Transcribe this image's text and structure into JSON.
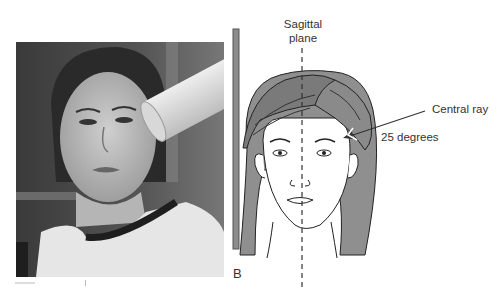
{
  "figure": {
    "panels": [
      {
        "id": "A",
        "label": "A",
        "description": "Photograph of a patient seated facing forward with x-ray tube positioned at the side of the head"
      },
      {
        "id": "B",
        "label": "B",
        "description": "Line drawing of a head, frontal view, with image receptor bar, sagittal plane line and central ray arrow"
      }
    ],
    "annotations": {
      "sagittal_plane_line1": "Sagittal",
      "sagittal_plane_line2": "plane",
      "central_ray": "Central ray",
      "angle": "25 degrees"
    },
    "colors": {
      "hair": "#8a8a8a",
      "hair_dark": "#6f6f6f",
      "line": "#2b2b2b",
      "bar": "#8c8c8c",
      "photo_bg": "#4a4a4a"
    }
  }
}
